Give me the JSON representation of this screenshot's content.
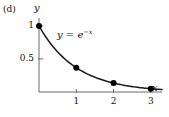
{
  "panel": {
    "label": "(d)"
  },
  "chart_data": {
    "type": "line",
    "title": "",
    "subtitle": "",
    "xlabel": "x",
    "ylabel": "y",
    "equation_label": "y = e",
    "equation_exponent": "−x",
    "function": "y = e^(-x)",
    "x": [
      0,
      1,
      2,
      3
    ],
    "values": [
      1,
      0.368,
      0.135,
      0.05
    ],
    "series": [
      {
        "name": "y = e^(-x)",
        "x": [
          0,
          1,
          2,
          3
        ],
        "values": [
          1,
          0.368,
          0.135,
          0.05
        ]
      }
    ],
    "markers": "filled-circle",
    "marker_color": "#000000",
    "line_color": "#1a1a1a",
    "xlim": [
      0,
      3.3
    ],
    "ylim": [
      0,
      1.12
    ],
    "xticks": [
      1,
      2,
      3
    ],
    "xtick_labels": [
      "1",
      "2",
      "3"
    ],
    "yticks": [
      0.5,
      1
    ],
    "ytick_labels": [
      "0.5",
      "1"
    ],
    "grid": false,
    "legend": "none",
    "axis_style": "open-corner-l-shape",
    "background": "#ffffff"
  }
}
